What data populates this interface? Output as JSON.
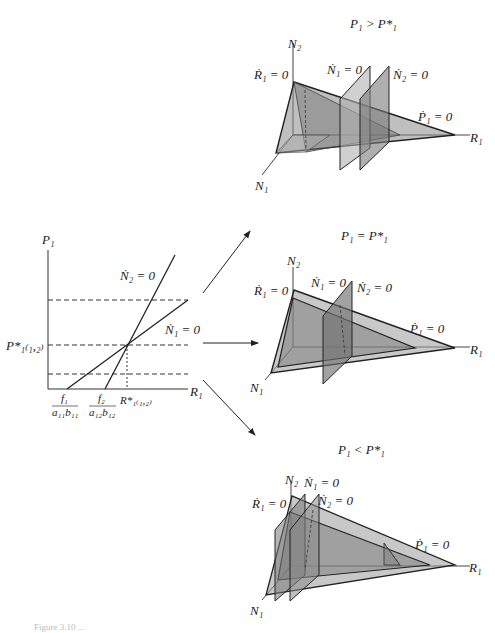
{
  "left_plot": {
    "y_axis_label": "P₁",
    "x_axis_label": "R₁",
    "p_star_label": "P*₁₍₁,₂₎",
    "r_star_label": "R*₁₍₁,₂₎",
    "x_tick_1": {
      "num": "f₁",
      "den": "a₁₁b₁₁"
    },
    "x_tick_2": {
      "num": "f₂",
      "den": "a₁₂b₁₂"
    },
    "line_n2_label": "Ṅ₂ = 0",
    "line_n1_label": "Ṅ₁ = 0"
  },
  "panels": [
    {
      "title": "P₁ > P*₁",
      "axis_n2": "N₂",
      "axis_n1": "N₁",
      "axis_r1": "R₁",
      "label_r1dot": "Ṙ₁ = 0",
      "label_n1dot": "Ṅ₁ = 0",
      "label_n2dot": "Ṅ₂ = 0",
      "label_p1dot": "Ṗ₁ = 0"
    },
    {
      "title": "P₁ = P*₁",
      "axis_n2": "N₂",
      "axis_n1": "N₁",
      "axis_r1": "R₁",
      "label_r1dot": "Ṙ₁ = 0",
      "label_n1dot": "Ṅ₁ = 0",
      "label_n2dot": "Ṅ₂ = 0",
      "label_p1dot": "Ṗ₁ = 0"
    },
    {
      "title": "P₁ < P*₁",
      "axis_n2": "N₂",
      "axis_n1": "N₁",
      "axis_r1": "R₁",
      "label_r1dot": "Ṙ₁ = 0",
      "label_n1dot": "Ṅ₁ = 0",
      "label_n2dot": "Ṅ₂ = 0",
      "label_p1dot": "Ṗ₁ = 0"
    }
  ],
  "caption": "Figure 3.10  ..."
}
